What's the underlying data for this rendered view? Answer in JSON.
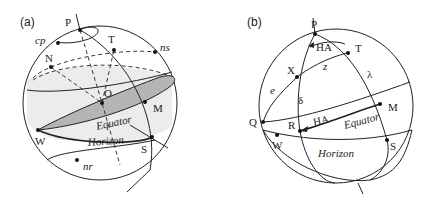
{
  "figure": {
    "panels": [
      {
        "id": "a",
        "label": "(a)",
        "points": {
          "P": "P",
          "cp": "cp",
          "T": "T",
          "ns": "ns",
          "N": "N",
          "O": "O",
          "M": "M",
          "W": "W",
          "S": "S",
          "nr": "nr"
        },
        "circles": {
          "equator": "Equator",
          "horizon": "Horizon"
        }
      },
      {
        "id": "b",
        "label": "(b)",
        "points": {
          "P": "P",
          "T": "T",
          "X": "X",
          "M": "M",
          "Q": "Q",
          "R": "R",
          "W": "W",
          "S": "S"
        },
        "arcs": {
          "ha_top": "HA",
          "ha_eq": "HA",
          "z": "z",
          "lambda": "λ",
          "e": "e",
          "delta": "δ"
        },
        "circles": {
          "equator": "Equator",
          "horizon": "Horizon"
        }
      }
    ]
  },
  "colors": {
    "line": "#222222",
    "equator_fill": "#b5b5b5",
    "horizon_fill": "#ececec"
  }
}
